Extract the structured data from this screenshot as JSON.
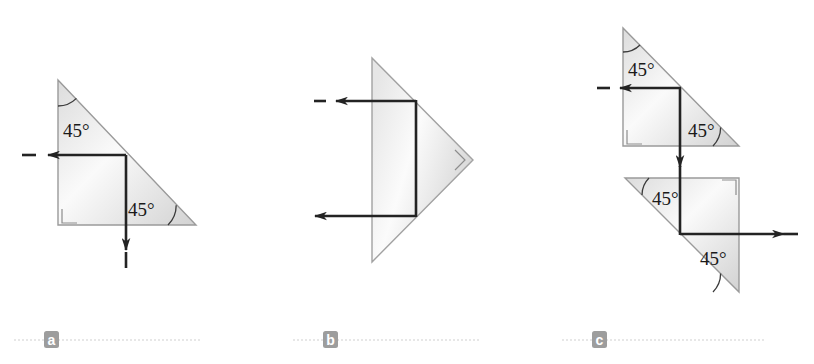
{
  "figure": {
    "background_color": "#ffffff",
    "ink_color": "#232323",
    "prism_outline_color": "#9a9a9a",
    "prism_fill_light": "#fbfbfb",
    "prism_fill_dark": "#d6d6d6",
    "badge_color": "#9d9d9d",
    "rule_color": "#c9c9c9",
    "panels": [
      {
        "id": "a",
        "letter": "a",
        "badge": {
          "x": 44,
          "y": 331,
          "width": 15,
          "height": 17
        },
        "rule": {
          "x1": 14,
          "y1": 340,
          "x2": 200,
          "y2": 340
        },
        "prisms": [
          {
            "name": "prism-a",
            "points": "58,80 58,225 196,225",
            "right_angle_marker": {
              "x": 62,
              "y": 207,
              "size": 16,
              "corner": "bottom-left"
            }
          }
        ],
        "angle_labels": [
          {
            "text": "45°",
            "x": 63,
            "y": 137,
            "arc": {
              "cx": 58,
              "cy": 80,
              "r": 26,
              "start": 0,
              "end": 45
            }
          },
          {
            "text": "45°",
            "x": 128,
            "y": 216,
            "arc": {
              "cx": 196,
              "cy": 225,
              "r": 28,
              "start": 135,
              "end": 180
            }
          }
        ],
        "rays": [
          {
            "name": "incident-ray",
            "type": "arrow",
            "x1": 22,
            "y1": 155,
            "x2": 126,
            "y2": 155,
            "head_at": "start",
            "head_x": 48,
            "head_y": 155
          },
          {
            "name": "internal-ray-horizontal",
            "type": "line",
            "x1": 48,
            "y1": 155,
            "x2": 126,
            "y2": 155
          },
          {
            "name": "refracted-ray-down",
            "type": "arrow",
            "x1": 126,
            "y1": 155,
            "x2": 126,
            "y2": 268,
            "head_at": "end",
            "head_x": 126,
            "head_y": 248
          }
        ]
      },
      {
        "id": "b",
        "letter": "b",
        "badge": {
          "x": 323,
          "y": 331,
          "width": 15,
          "height": 17
        },
        "rule": {
          "x1": 293,
          "y1": 340,
          "x2": 480,
          "y2": 340
        },
        "prisms": [
          {
            "name": "prism-b",
            "points": "372,58 372,262 473,160",
            "right_angle_marker": {
              "x": 456,
              "y": 152,
              "size": 14,
              "corner": "right-rotated"
            }
          }
        ],
        "angle_labels": [],
        "rays": [
          {
            "name": "incident-ray",
            "type": "arrow",
            "x1": 314,
            "y1": 101,
            "x2": 416,
            "y2": 101,
            "head_at": "start",
            "head_x": 336,
            "head_y": 101
          },
          {
            "name": "internal-ray-vertical",
            "type": "line",
            "x1": 416,
            "y1": 101,
            "x2": 416,
            "y2": 216
          },
          {
            "name": "exit-ray",
            "type": "arrow",
            "x1": 416,
            "y1": 216,
            "x2": 313,
            "y2": 216,
            "head_at": "end",
            "head_x": 313,
            "head_y": 216
          }
        ]
      },
      {
        "id": "c",
        "letter": "c",
        "badge": {
          "x": 592,
          "y": 331,
          "width": 15,
          "height": 17
        },
        "rule": {
          "x1": 562,
          "y1": 340,
          "x2": 766,
          "y2": 340
        },
        "prisms": [
          {
            "name": "prism-c-upper",
            "points": "623,28 623,146 739,146",
            "right_angle_marker": {
              "x": 627,
              "y": 128,
              "size": 16,
              "corner": "bottom-left"
            }
          },
          {
            "name": "prism-c-lower",
            "points": "625,178 739,178 739,292",
            "right_angle_marker": {
              "x": 719,
              "y": 182,
              "size": 16,
              "corner": "top-right"
            }
          }
        ],
        "angle_labels": [
          {
            "text": "45°",
            "x": 628,
            "y": 73,
            "arc": {
              "cx": 623,
              "cy": 28,
              "r": 24,
              "start": 0,
              "end": 45
            }
          },
          {
            "text": "45°",
            "x": 688,
            "y": 134,
            "arc": {
              "cx": 739,
              "cy": 146,
              "r": 26,
              "start": 135,
              "end": 180
            }
          },
          {
            "text": "45°",
            "x": 650,
            "y": 203,
            "arc": {
              "cx": 625,
              "cy": 178,
              "r": 24,
              "start": -45,
              "end": 0
            }
          },
          {
            "text": "45°",
            "x": 700,
            "y": 262,
            "arc": {
              "cx": 739,
              "cy": 292,
              "r": 26,
              "start": 180,
              "end": 225
            }
          }
        ],
        "rays": [
          {
            "name": "incident-ray",
            "type": "arrow",
            "x1": 597,
            "y1": 88,
            "x2": 680,
            "y2": 88,
            "head_at": "start",
            "head_x": 620,
            "head_y": 88
          },
          {
            "name": "internal-ray-down",
            "type": "arrow",
            "x1": 680,
            "y1": 88,
            "x2": 680,
            "y2": 178,
            "head_at": "end",
            "head_x": 680,
            "head_y": 165
          },
          {
            "name": "transfer-ray-down",
            "type": "line",
            "x1": 680,
            "y1": 178,
            "x2": 680,
            "y2": 234
          },
          {
            "name": "exit-ray",
            "type": "arrow",
            "x1": 680,
            "y1": 234,
            "x2": 790,
            "y2": 234,
            "head_at": "end",
            "head_x": 782,
            "head_y": 234
          }
        ]
      }
    ]
  }
}
